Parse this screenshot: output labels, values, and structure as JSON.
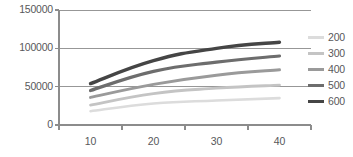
{
  "chart_data": {
    "type": "line",
    "title": "",
    "xlabel": "",
    "ylabel": "",
    "x": [
      10,
      20,
      30,
      40
    ],
    "xlim": [
      5,
      45
    ],
    "ylim": [
      0,
      150000
    ],
    "grid": true,
    "legend_position": "right",
    "x_ticks": [
      "10",
      "20",
      "30",
      "40"
    ],
    "y_ticks": [
      "0",
      "50000",
      "100000",
      "150000"
    ],
    "y_tick_values": [
      0,
      50000,
      100000,
      150000
    ],
    "series": [
      {
        "name": "200",
        "color": "#dcdcdc",
        "width": 2.6,
        "values": [
          18000,
          28000,
          32000,
          35000
        ]
      },
      {
        "name": "300",
        "color": "#c4c4c4",
        "width": 2.8,
        "values": [
          26000,
          41000,
          48000,
          52000
        ]
      },
      {
        "name": "400",
        "color": "#9a9a9a",
        "width": 3.0,
        "values": [
          36000,
          53000,
          65000,
          72000
        ]
      },
      {
        "name": "500",
        "color": "#6d6d6d",
        "width": 3.2,
        "values": [
          45000,
          70000,
          82000,
          90000
        ]
      },
      {
        "name": "600",
        "color": "#454545",
        "width": 3.4,
        "values": [
          54000,
          84000,
          100000,
          108000
        ]
      }
    ],
    "axis_color": "#8c8c8c",
    "grid_color": "#8c8c8c",
    "text_color": "#58585a",
    "background": "#ffffff"
  }
}
